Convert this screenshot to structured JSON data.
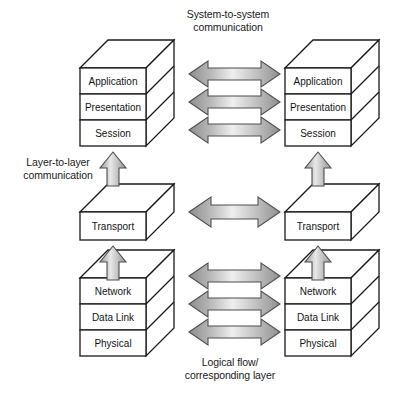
{
  "diagram": {
    "background": "#ffffff",
    "line_color": "#1a1a1a",
    "face_color": "#ffffff",
    "arrow_light": "#f2f2f2",
    "arrow_mid": "#c9c9c9",
    "arrow_dark": "#8d8d8d"
  },
  "captions": {
    "top_line1": "System-to-system",
    "top_line2": "communication",
    "left_line1": "Layer-to-layer",
    "left_line2": "communication",
    "bottom_line1": "Logical flow/",
    "bottom_line2": "corresponding layer"
  },
  "left_stack": {
    "upper": {
      "layers": [
        "Application",
        "Presentation",
        "Session"
      ]
    },
    "middle": {
      "layers": [
        "Transport"
      ]
    },
    "lower": {
      "layers": [
        "Network",
        "Data Link",
        "Physical"
      ]
    }
  },
  "right_stack": {
    "upper": {
      "layers": [
        "Application",
        "Presentation",
        "Session"
      ]
    },
    "middle": {
      "layers": [
        "Transport"
      ]
    },
    "lower": {
      "layers": [
        "Network",
        "Data Link",
        "Physical"
      ]
    }
  },
  "horizontal_arrows": {
    "top_group": [
      "Application",
      "Presentation",
      "Session"
    ],
    "middle_group": [
      "Transport"
    ],
    "bottom_group": [
      "Network",
      "Data Link",
      "Physical"
    ]
  },
  "vertical_arrows": {
    "left": [
      "session-to-transport",
      "transport-to-network"
    ],
    "right": [
      "session-to-transport",
      "transport-to-network"
    ]
  }
}
